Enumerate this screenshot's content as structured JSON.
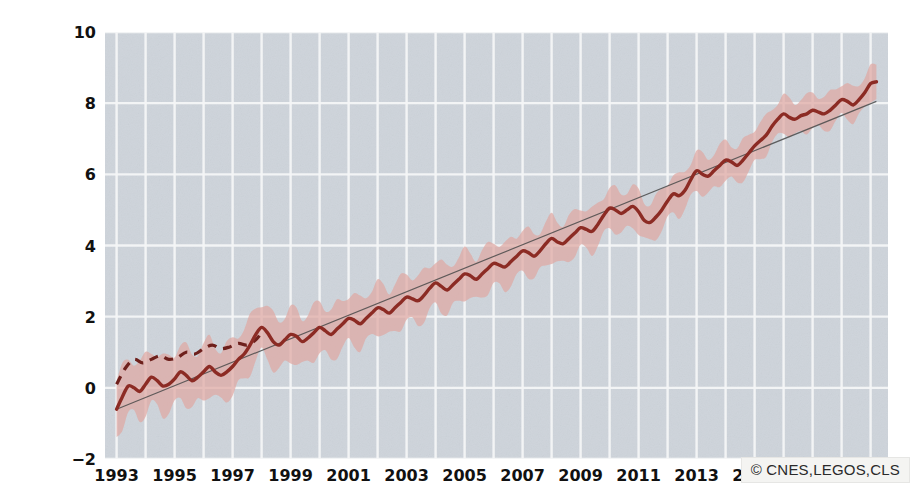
{
  "chart_data": {
    "type": "line",
    "title": "",
    "xlabel": "",
    "ylabel": "Veränderungen des Meeresspiegel in cm",
    "xlim": [
      1992.6,
      2019.6
    ],
    "ylim": [
      -2,
      10
    ],
    "xticks": [
      "1993",
      "1995",
      "1997",
      "1999",
      "2001",
      "2003",
      "2005",
      "2007",
      "2009",
      "2011",
      "2013",
      "2015",
      "2017",
      "2019"
    ],
    "xtick_values": [
      1993,
      1995,
      1997,
      1999,
      2001,
      2003,
      2005,
      2007,
      2009,
      2011,
      2013,
      2015,
      2017,
      2019
    ],
    "yticks": [
      "-2",
      "0",
      "2",
      "4",
      "6",
      "8",
      "10"
    ],
    "ytick_values": [
      -2,
      0,
      2,
      4,
      6,
      8,
      10
    ],
    "grid": true,
    "grid_color": "#f5f6f7",
    "plot_background": "#ced4db",
    "figure_background": "#ffffff",
    "legend_position": "none",
    "annotations": [
      {
        "name": "attribution",
        "text": "© CNES,LEGOS,CLS",
        "position": "bottom-right"
      }
    ],
    "series": [
      {
        "name": "Meeresspiegel (Messreihe)",
        "style": "solid",
        "color": "#8c2b24",
        "x": [
          1993.0,
          1993.2,
          1993.4,
          1993.6,
          1993.8,
          1994.0,
          1994.2,
          1994.4,
          1994.6,
          1994.8,
          1995.0,
          1995.2,
          1995.4,
          1995.6,
          1995.8,
          1996.0,
          1996.2,
          1996.4,
          1996.6,
          1996.8,
          1997.0,
          1997.2,
          1997.4,
          1997.6,
          1997.8,
          1998.0,
          1998.2,
          1998.4,
          1998.6,
          1998.8,
          1999.0,
          1999.2,
          1999.4,
          1999.6,
          1999.8,
          2000.0,
          2000.2,
          2000.4,
          2000.6,
          2000.8,
          2001.0,
          2001.2,
          2001.4,
          2001.6,
          2001.8,
          2002.0,
          2002.2,
          2002.4,
          2002.6,
          2002.8,
          2003.0,
          2003.2,
          2003.4,
          2003.6,
          2003.8,
          2004.0,
          2004.2,
          2004.4,
          2004.6,
          2004.8,
          2005.0,
          2005.2,
          2005.4,
          2005.6,
          2005.8,
          2006.0,
          2006.2,
          2006.4,
          2006.6,
          2006.8,
          2007.0,
          2007.2,
          2007.4,
          2007.6,
          2007.8,
          2008.0,
          2008.2,
          2008.4,
          2008.6,
          2008.8,
          2009.0,
          2009.2,
          2009.4,
          2009.6,
          2009.8,
          2010.0,
          2010.2,
          2010.4,
          2010.6,
          2010.8,
          2011.0,
          2011.2,
          2011.4,
          2011.6,
          2011.8,
          2012.0,
          2012.2,
          2012.4,
          2012.6,
          2012.8,
          2013.0,
          2013.2,
          2013.4,
          2013.6,
          2013.8,
          2014.0,
          2014.2,
          2014.4,
          2014.6,
          2014.8,
          2015.0,
          2015.2,
          2015.4,
          2015.6,
          2015.8,
          2016.0,
          2016.2,
          2016.4,
          2016.6,
          2016.8,
          2017.0,
          2017.2,
          2017.4,
          2017.6,
          2017.8,
          2018.0,
          2018.2,
          2018.4,
          2018.6,
          2018.8,
          2019.0,
          2019.2
        ],
        "y": [
          -0.6,
          -0.25,
          0.05,
          0.0,
          -0.1,
          0.1,
          0.3,
          0.2,
          0.05,
          0.1,
          0.25,
          0.45,
          0.35,
          0.2,
          0.3,
          0.45,
          0.6,
          0.45,
          0.35,
          0.45,
          0.6,
          0.8,
          0.95,
          1.2,
          1.5,
          1.7,
          1.55,
          1.3,
          1.2,
          1.35,
          1.5,
          1.45,
          1.3,
          1.4,
          1.55,
          1.7,
          1.6,
          1.5,
          1.65,
          1.8,
          1.95,
          1.9,
          1.8,
          1.95,
          2.1,
          2.25,
          2.2,
          2.1,
          2.25,
          2.4,
          2.55,
          2.5,
          2.45,
          2.6,
          2.8,
          2.95,
          2.85,
          2.75,
          2.9,
          3.05,
          3.2,
          3.15,
          3.05,
          3.2,
          3.35,
          3.5,
          3.45,
          3.4,
          3.55,
          3.7,
          3.85,
          3.8,
          3.7,
          3.85,
          4.05,
          4.2,
          4.1,
          4.05,
          4.2,
          4.35,
          4.5,
          4.45,
          4.4,
          4.6,
          4.85,
          5.05,
          5.0,
          4.9,
          5.0,
          5.1,
          4.95,
          4.7,
          4.65,
          4.8,
          5.0,
          5.25,
          5.45,
          5.4,
          5.55,
          5.85,
          6.1,
          6.0,
          5.95,
          6.1,
          6.25,
          6.4,
          6.35,
          6.25,
          6.4,
          6.6,
          6.8,
          6.95,
          7.1,
          7.35,
          7.55,
          7.7,
          7.6,
          7.55,
          7.65,
          7.7,
          7.8,
          7.75,
          7.7,
          7.8,
          7.95,
          8.1,
          8.05,
          7.95,
          8.1,
          8.3,
          8.55,
          8.6
        ],
        "uncertainty_upper_offset": 0.75,
        "uncertainty_lower_offset": 0.75,
        "uncertainty_color": "#dfa8a2"
      },
      {
        "name": "Frühe Messreihe (gestrichelt)",
        "style": "dashed",
        "color": "#6e201c",
        "x": [
          1993.0,
          1993.3,
          1993.6,
          1993.9,
          1994.2,
          1994.5,
          1994.8,
          1995.1,
          1995.4,
          1995.7,
          1996.0,
          1996.3,
          1996.6,
          1996.9,
          1997.2,
          1997.5,
          1997.8,
          1998.0
        ],
        "y": [
          0.1,
          0.55,
          0.8,
          0.7,
          0.8,
          0.9,
          0.8,
          0.85,
          1.0,
          0.95,
          1.1,
          1.2,
          1.1,
          1.15,
          1.25,
          1.2,
          1.35,
          1.55
        ]
      },
      {
        "name": "Linearer Trend",
        "style": "thin-line",
        "color": "#4a4a4a",
        "x": [
          1993.0,
          2019.2
        ],
        "y": [
          -0.6,
          8.05
        ]
      }
    ]
  }
}
